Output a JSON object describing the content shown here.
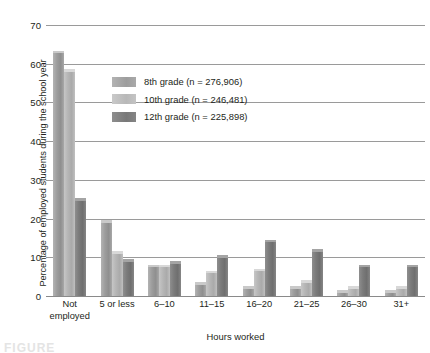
{
  "chart_data": {
    "type": "bar",
    "title": "",
    "xlabel": "Hours worked",
    "ylabel": "Percentage of employed students during the school year",
    "ylim": [
      0,
      70
    ],
    "yticks": [
      0,
      10,
      20,
      30,
      40,
      50,
      60,
      70
    ],
    "grid": true,
    "legend_position": "upper-center-left",
    "categories": [
      "Not employed",
      "5 or less",
      "6–10",
      "11–15",
      "16–20",
      "21–25",
      "26–30",
      "31+"
    ],
    "series": [
      {
        "name": "8th grade (n = 276,906)",
        "short_name": "8th grade",
        "n": "276,906",
        "color": "#9d9d9d",
        "values": [
          62.8,
          19.0,
          7.5,
          3.0,
          2.0,
          2.0,
          1.0,
          1.0
        ]
      },
      {
        "name": "10th grade (n = 246,481)",
        "short_name": "10th grade",
        "n": "246,481",
        "color": "#b8b8b8",
        "values": [
          58.0,
          11.0,
          7.5,
          6.0,
          6.5,
          3.5,
          2.0,
          2.0
        ]
      },
      {
        "name": "12th grade (n = 225,898)",
        "short_name": "12th grade",
        "n": "225,898",
        "color": "#787878",
        "values": [
          24.8,
          9.0,
          8.5,
          10.0,
          14.0,
          11.5,
          7.5,
          7.5
        ]
      }
    ]
  },
  "caption": {
    "partial_text": "FIGURE"
  }
}
